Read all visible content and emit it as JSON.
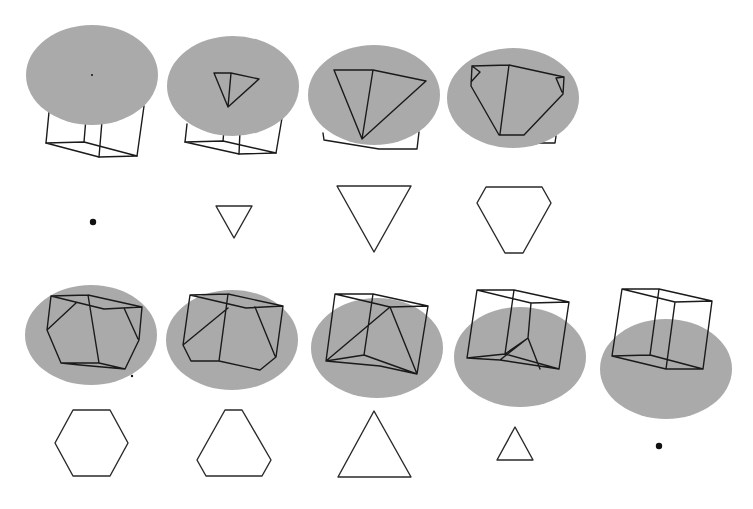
{
  "caption_fragment": "…",
  "colors": {
    "background": "#ffffff",
    "plane": "#aaaaaa",
    "edges": "#1a1a1a"
  },
  "diagram": {
    "rows": [
      {
        "frames": [
          {
            "index": 1,
            "cross_section": "point"
          },
          {
            "index": 2,
            "cross_section": "small triangle (inverted)"
          },
          {
            "index": 3,
            "cross_section": "large triangle (inverted)"
          },
          {
            "index": 4,
            "cross_section": "truncated triangle (hexagon)"
          }
        ]
      },
      {
        "frames": [
          {
            "index": 5,
            "cross_section": "regular hexagon"
          },
          {
            "index": 6,
            "cross_section": "truncated triangle (hexagon)"
          },
          {
            "index": 7,
            "cross_section": "large triangle"
          },
          {
            "index": 8,
            "cross_section": "small triangle"
          },
          {
            "index": 9,
            "cross_section": "point"
          }
        ]
      }
    ]
  }
}
